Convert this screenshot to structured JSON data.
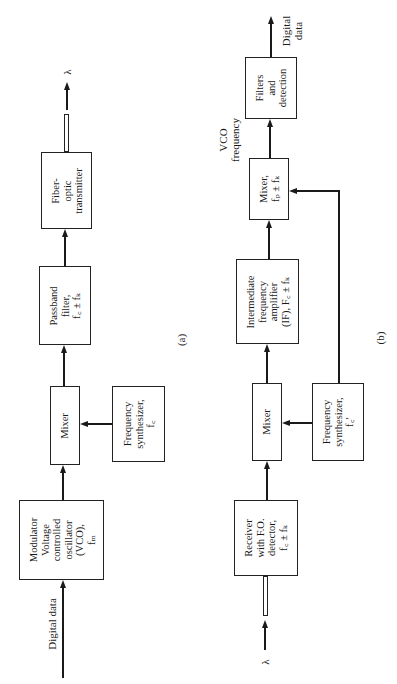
{
  "diagram_a": {
    "caption": "(a)",
    "input_label": "Digital data",
    "output_label": "λ",
    "blocks": {
      "modulator": [
        "Modulator",
        "Voltage",
        "controlled",
        "oscillator",
        "(VCO),",
        "fₘ"
      ],
      "mixer": [
        "Mixer"
      ],
      "synthesizer": [
        "Frequency",
        "synthesizer,",
        "f꜀"
      ],
      "passband": [
        "Passband",
        "filter,",
        "f꜀ ± fₖ"
      ],
      "transmitter": [
        "Fiber-",
        "optic",
        "transmitter"
      ]
    }
  },
  "diagram_b": {
    "caption": "(b)",
    "input_label": "λ",
    "output_label_lines": [
      "Digital",
      "data"
    ],
    "vco_label_lines": [
      "VCO",
      "frequency"
    ],
    "blocks": {
      "receiver": [
        "Receiver",
        "with F.O.",
        "detector,",
        "f꜀ ± fₖ"
      ],
      "mixer": [
        "Mixer"
      ],
      "synthesizer": [
        "Frequency",
        "synthesizer,",
        "f꜀′"
      ],
      "if_amp": [
        "Intermediate",
        "frequency",
        "amplifier",
        "(IF), F꜀ ± fₖ"
      ],
      "mixer2": [
        "Mixer,",
        "fₚ ± fₖ"
      ],
      "filters": [
        "Filters",
        "and",
        "detection"
      ]
    }
  }
}
